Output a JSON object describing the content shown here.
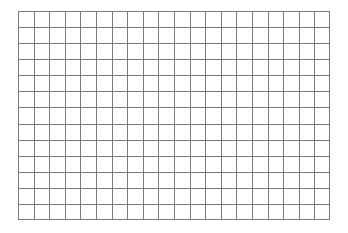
{
  "grid": {
    "columns": 20,
    "rows": 13,
    "line_color": "#7a7a7a",
    "background": "#ffffff"
  }
}
